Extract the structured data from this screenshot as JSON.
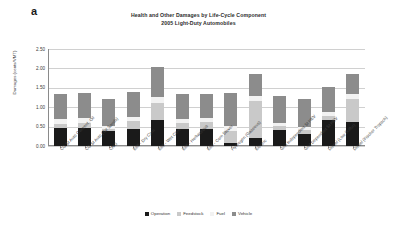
{
  "panel_letter": "a",
  "chart_data": {
    "type": "bar",
    "subtype": "stacked-bar",
    "title": "Health and Other Damages by Life-Cycle Component",
    "subtitle": "2005 Light-Duty Automobiles",
    "xlabel": "",
    "ylabel": "Damages (cents/VMT)",
    "ylim": [
      0.0,
      2.5
    ],
    "yticks": [
      "2.50",
      "2.00",
      "1.50",
      "1.00",
      "0.50",
      "0.00"
    ],
    "ytick_values": [
      2.5,
      2.0,
      1.5,
      1.0,
      0.5,
      0.0
    ],
    "grid": true,
    "legend_position": "bottom",
    "categories": [
      "CG SI Auto Convent. Oil",
      "CG SI Auto (Tar Sands)",
      "CNG",
      "E85 - Dry Corn",
      "E85 - Wet Corn",
      "E85 - Herbaceous",
      "E85 - Corn Stover",
      "Hydrogen (Gaseous)",
      "Electric",
      "Grid Independent SI HEV",
      "Grid Dependent SI HEV",
      "Diesel (Low Sulfur)",
      "Diesel (Fischer Tropsch)"
    ],
    "series": [
      {
        "name": "Operation",
        "color": "#1a1a1a",
        "values": [
          0.46,
          0.46,
          0.38,
          0.44,
          0.66,
          0.44,
          0.44,
          0.09,
          0.21,
          0.41,
          0.3,
          0.66,
          0.63
        ]
      },
      {
        "name": "Feedstock",
        "color": "#c9c9c9",
        "values": [
          0.12,
          0.13,
          0.05,
          0.21,
          0.45,
          0.16,
          0.17,
          0.3,
          0.95,
          0.1,
          0.11,
          0.12,
          0.57
        ]
      },
      {
        "name": "Fuel",
        "color": "#f2f2f2",
        "values": [
          0.11,
          0.14,
          0.09,
          0.11,
          0.15,
          0.09,
          0.1,
          0.13,
          0.13,
          0.09,
          0.09,
          0.1,
          0.13
        ]
      },
      {
        "name": "Vehicle",
        "color": "#8c8c8c",
        "values": [
          0.64,
          0.64,
          0.68,
          0.64,
          0.79,
          0.64,
          0.64,
          0.86,
          0.56,
          0.7,
          0.72,
          0.64,
          0.52
        ]
      }
    ]
  }
}
